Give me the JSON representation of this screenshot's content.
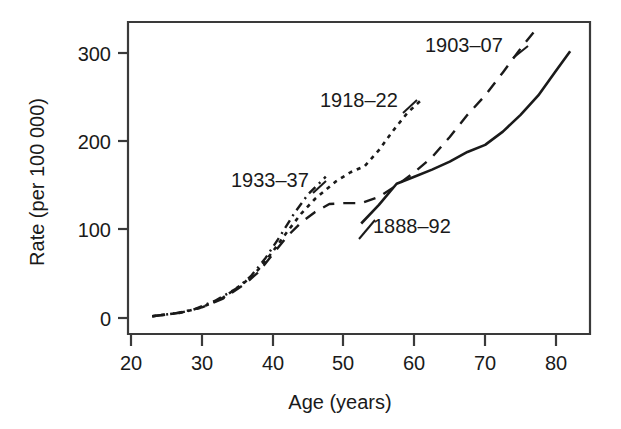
{
  "chart_data": {
    "type": "line",
    "title": "",
    "subtitle": "",
    "xlabel": "Age (years)",
    "ylabel": "Rate (per 100 000)",
    "xlim": [
      18,
      84
    ],
    "ylim": [
      -10,
      337
    ],
    "xticks": [
      20,
      30,
      40,
      50,
      60,
      70,
      80
    ],
    "xtick_labels": [
      "20",
      "30",
      "40",
      "50",
      "60",
      "70",
      "80"
    ],
    "yticks": [
      0,
      100,
      200,
      300
    ],
    "ytick_labels": [
      "0",
      "100",
      "200",
      "300"
    ],
    "grid": false,
    "legend_position": "inline-annotations",
    "series": [
      {
        "name": "1888–92",
        "dash": "solid",
        "label_text": "1888–92",
        "x": [
          52.5,
          55,
          57.5,
          60,
          62.5,
          65,
          67.5,
          70,
          72.5,
          75,
          77.5,
          80,
          82
        ],
        "y": [
          107,
          128,
          152,
          160,
          168,
          177,
          188,
          196,
          211,
          230,
          252,
          280,
          302
        ]
      },
      {
        "name": "1903–07",
        "dash": "dashed",
        "label_text": "1903–07",
        "x": [
          23,
          27,
          30,
          33,
          36,
          38,
          40,
          42,
          44,
          46,
          48,
          50,
          52.5,
          55,
          57.5,
          60,
          62.5,
          65,
          67.5,
          70,
          72.5,
          75,
          77
        ],
        "y": [
          2,
          6,
          12,
          22,
          38,
          52,
          72,
          92,
          108,
          120,
          129,
          130,
          130,
          137,
          150,
          165,
          182,
          205,
          230,
          252,
          278,
          305,
          325
        ]
      },
      {
        "name": "1918–22",
        "dash": "dotted",
        "label_text": "1918–22",
        "x": [
          23,
          27,
          30,
          33,
          36,
          38,
          40,
          42,
          44,
          46,
          47.5,
          49,
          51,
          53,
          55,
          57,
          59,
          61
        ],
        "y": [
          2,
          6,
          12,
          23,
          40,
          55,
          75,
          97,
          118,
          135,
          145,
          155,
          165,
          172,
          190,
          212,
          232,
          247
        ]
      },
      {
        "name": "1933–37",
        "dash": "dashdot",
        "label_text": "1933–37",
        "x": [
          23,
          26,
          29,
          32,
          35,
          37,
          39,
          41,
          43,
          45,
          46.5,
          47.5
        ],
        "y": [
          2,
          5,
          10,
          20,
          34,
          48,
          68,
          92,
          118,
          140,
          152,
          160
        ]
      }
    ],
    "annotations": [
      {
        "text": "1903–07",
        "x_px": 425,
        "y_px": 52,
        "anchor": "start"
      },
      {
        "text": "1918–22",
        "x_px": 320,
        "y_px": 107,
        "anchor": "start"
      },
      {
        "text": "1933–37",
        "x_px": 231,
        "y_px": 187,
        "anchor": "start"
      },
      {
        "text": "1888–92",
        "x_px": 373,
        "y_px": 233,
        "anchor": "start"
      }
    ]
  }
}
